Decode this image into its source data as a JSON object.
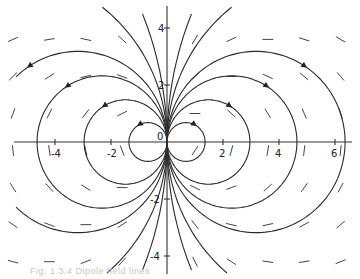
{
  "chart_data": {
    "type": "line",
    "title": "",
    "subtitle": "",
    "xlabel": "",
    "ylabel": "",
    "xlim": [
      -5.9,
      6.8
    ],
    "ylim": [
      -4.8,
      4.9
    ],
    "grid": false,
    "legend": null,
    "x_ticks": [
      -4,
      -2,
      2,
      4,
      6
    ],
    "y_ticks": [
      4,
      2,
      -2,
      -4
    ],
    "x_tick_labels": [
      "-4",
      "-2",
      "2",
      "4",
      "6"
    ],
    "y_tick_labels": [
      "4",
      "2",
      "-2",
      "-4"
    ],
    "origin_label": "0",
    "series": [
      {
        "name": "circle r=0.68 right",
        "center": [
          0.68,
          0
        ],
        "radius": 0.68
      },
      {
        "name": "circle r=1.48 right",
        "center": [
          1.48,
          0
        ],
        "radius": 1.48
      },
      {
        "name": "circle r=2.32 right",
        "center": [
          2.32,
          0
        ],
        "radius": 2.32
      },
      {
        "name": "circle r=3.18 right",
        "center": [
          3.18,
          0
        ],
        "radius": 3.18
      },
      {
        "name": "circle r=0.68 left",
        "center": [
          -0.68,
          0
        ],
        "radius": 0.68
      },
      {
        "name": "circle r=1.48 left",
        "center": [
          -1.48,
          0
        ],
        "radius": 1.48
      },
      {
        "name": "circle r=2.32 left",
        "center": [
          -2.32,
          0
        ],
        "radius": 2.32
      },
      {
        "name": "circle r=3.18 left",
        "center": [
          -3.18,
          0
        ],
        "radius": 3.18
      },
      {
        "name": "circle r=6 right",
        "center": [
          6,
          0
        ],
        "radius": 6
      },
      {
        "name": "circle r=6 left",
        "center": [
          -6,
          0
        ],
        "radius": 6
      },
      {
        "name": "circle r=12 right",
        "center": [
          12,
          0
        ],
        "radius": 12
      },
      {
        "name": "circle r=12 left",
        "center": [
          -12,
          0
        ],
        "radius": 12
      },
      {
        "name": "y-axis field line",
        "x": [
          0,
          0
        ],
        "y": [
          -4.8,
          4.9
        ]
      }
    ],
    "arrow_direction": "clockwise on right circles (top going right), counterclockwise on left circles (top going left)"
  },
  "caption": "Fig. 1.3.4 Dipole field lines"
}
